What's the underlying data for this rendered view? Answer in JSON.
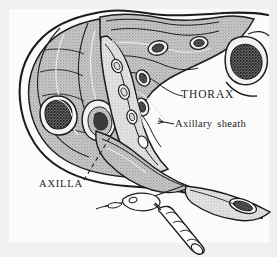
{
  "figure": {
    "kind": "anatomical-illustration",
    "width": 277,
    "height": 257,
    "style": "pen-and-ink line drawing with stipple / halftone tissue shading"
  },
  "labels": {
    "thorax": "THORAX",
    "axillary_sheath": "Axillary sheath",
    "axilla": "AXILLA"
  },
  "leaders": {
    "axillary_sheath": {
      "type": "arrow",
      "from": [
        176,
        124
      ],
      "to": [
        157,
        121
      ],
      "style": "solid-with-arrowhead"
    },
    "axilla": {
      "type": "dashed-line",
      "from": [
        84,
        180
      ],
      "to": [
        112,
        134
      ],
      "style": "dashed"
    }
  },
  "structures": [
    {
      "name": "skin-outline",
      "note": "continuous heavy contour of shoulder, arm and chest wall"
    },
    {
      "name": "deltoid-muscle",
      "note": "large stippled mass forming the shoulder"
    },
    {
      "name": "humerus-cross-section",
      "note": "cortical white rim with dark speckled marrow"
    },
    {
      "name": "pectoralis-muscles",
      "note": "stippled sheets across the anterior chest"
    },
    {
      "name": "rib-cross-sections",
      "note": "small oval bones within the chest wall"
    },
    {
      "name": "vertebral-body",
      "note": "speckled bone at the right margin of the thorax"
    },
    {
      "name": "axillary-sheath",
      "note": "fascial envelope containing artery, vein and brachial plexus"
    },
    {
      "name": "neurovascular-bundle",
      "note": "vessel and nerve lumens inside the sheath"
    },
    {
      "name": "distal-arm-bone",
      "note": "speckled bone cross-section in the distal arm"
    }
  ],
  "instruments": [
    {
      "name": "needle-and-catheter-hub",
      "note": "winged hub with short connecting tubing entering the axilla"
    },
    {
      "name": "syringe",
      "note": "graduated barrel angled downward to the right"
    }
  ],
  "colors": {
    "ink": "#1d1d1d",
    "tissue_fill": "#a8a8a8",
    "tissue_light": "#c9c9c9",
    "bone_marrow": "#2b2b2b",
    "paper": "#fbfbfb",
    "edge_band": "#f0f0f0"
  }
}
